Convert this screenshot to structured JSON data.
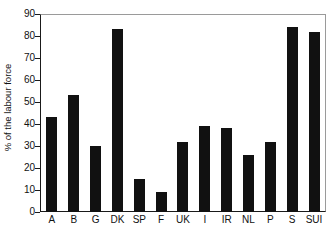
{
  "chart_data": {
    "type": "bar",
    "title": "",
    "subtitle": "",
    "xlabel": "",
    "ylabel": "% of the labour force",
    "ylim": [
      0,
      90
    ],
    "ytick_step": 10,
    "yticks": [
      0,
      10,
      20,
      30,
      40,
      50,
      60,
      70,
      80,
      90
    ],
    "ytick_labels": [
      "0",
      "10",
      "20",
      "30",
      "40",
      "50",
      "60",
      "70",
      "80",
      "90"
    ],
    "grid": false,
    "legend": null,
    "bar_color": "#111111",
    "frame_color": "#1a1a1a",
    "categories": [
      "A",
      "B",
      "G",
      "DK",
      "SP",
      "F",
      "UK",
      "I",
      "IR",
      "NL",
      "P",
      "S",
      "SUI"
    ],
    "values": [
      43,
      53,
      30,
      83,
      15,
      9,
      32,
      39,
      38,
      26,
      32,
      84,
      82
    ],
    "annotations": []
  }
}
